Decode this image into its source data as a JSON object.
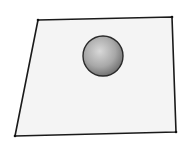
{
  "scene": {
    "description": "Sphere resting above a plane in perspective",
    "plane": {
      "corners": [
        [
          38,
          20
        ],
        [
          172,
          17
        ],
        [
          176,
          132
        ],
        [
          15,
          136
        ]
      ],
      "fill": "#f4f4f4",
      "stroke": "#1a1a1a"
    },
    "sphere": {
      "cx": 103,
      "cy": 56,
      "r": 20,
      "highlight": "#d8d8d8",
      "shade": "#7a7a7a",
      "stroke": "#2a2a2a"
    }
  }
}
